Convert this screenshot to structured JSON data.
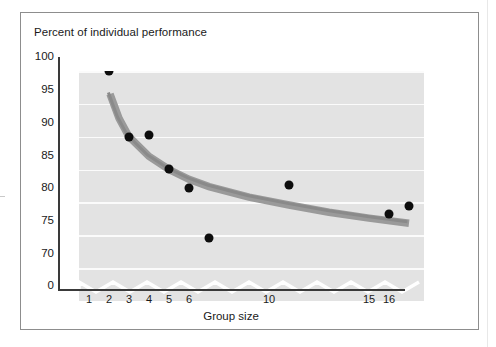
{
  "chart_data": {
    "type": "scatter",
    "title": "Percent of individual performance",
    "xlabel": "Group size",
    "ylabel": "",
    "x_tick_labels": [
      "1",
      "2",
      "3",
      "4",
      "5",
      "6",
      "10",
      "15",
      "16"
    ],
    "x_tick_values": [
      1,
      2,
      3,
      4,
      5,
      6,
      10,
      15,
      16
    ],
    "y_tick_labels": [
      "100",
      "95",
      "90",
      "85",
      "80",
      "75",
      "70",
      "0"
    ],
    "y_tick_values": [
      100,
      95,
      90,
      85,
      80,
      75,
      70,
      0
    ],
    "ylim": [
      70,
      100
    ],
    "axis_break": true,
    "axis_break_note": "y-axis broken between 70 and 0",
    "grid": true,
    "legend": null,
    "points": [
      {
        "x": 1,
        "y": 100.0,
        "label": "1"
      },
      {
        "x": 2,
        "y": 90.0,
        "label": "2"
      },
      {
        "x": 3,
        "y": 90.2,
        "label": "3"
      },
      {
        "x": 4,
        "y": 85.1,
        "label": "4"
      },
      {
        "x": 5,
        "y": 82.2,
        "label": "5"
      },
      {
        "x": 6,
        "y": 74.5,
        "label": "6"
      },
      {
        "x": 10,
        "y": 82.6,
        "label": "10"
      },
      {
        "x": 15,
        "y": 78.2,
        "label": "15"
      },
      {
        "x": 16,
        "y": 79.5,
        "label": "16"
      }
    ],
    "trend_curve": {
      "name": "fitted decay curve",
      "color": "#9a9a9a",
      "points": [
        {
          "x": 1.05,
          "y": 96.5
        },
        {
          "x": 1.5,
          "y": 92.8
        },
        {
          "x": 2,
          "y": 90.0
        },
        {
          "x": 3,
          "y": 87.0
        },
        {
          "x": 4,
          "y": 85.0
        },
        {
          "x": 5,
          "y": 83.5
        },
        {
          "x": 6,
          "y": 82.4
        },
        {
          "x": 8,
          "y": 80.8
        },
        {
          "x": 10,
          "y": 79.6
        },
        {
          "x": 12,
          "y": 78.5
        },
        {
          "x": 14,
          "y": 77.6
        },
        {
          "x": 16,
          "y": 76.8
        }
      ]
    },
    "colors": {
      "plot_background": "#e3e3e3",
      "gridline": "#fbfbfb",
      "point": "#0d0d0d",
      "curve": "#9a9a9a",
      "axis": "#3a3a3a",
      "frame_border": "#8d8d8d",
      "text": "#1a1a1a"
    }
  }
}
